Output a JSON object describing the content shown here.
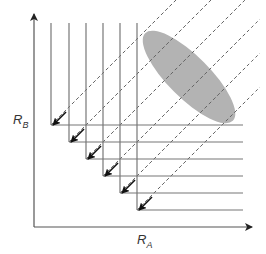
{
  "diagram": {
    "x_axis_label": "R",
    "x_axis_subscript": "A",
    "y_axis_label": "R",
    "y_axis_subscript": "B",
    "colors": {
      "axis": "#555555",
      "grid_lines": "#777777",
      "dashed_lines": "#666666",
      "ellipse_fill": "#b3b3b3",
      "arrow": "#111111"
    },
    "steps": [
      {
        "x": 51,
        "y": 125
      },
      {
        "x": 69,
        "y": 142
      },
      {
        "x": 86,
        "y": 159
      },
      {
        "x": 103,
        "y": 176
      },
      {
        "x": 120,
        "y": 193
      },
      {
        "x": 137,
        "y": 210
      }
    ],
    "ellipse": {
      "cx": 189,
      "cy": 77,
      "rx": 62,
      "ry": 21,
      "rotation_deg": 45
    }
  }
}
